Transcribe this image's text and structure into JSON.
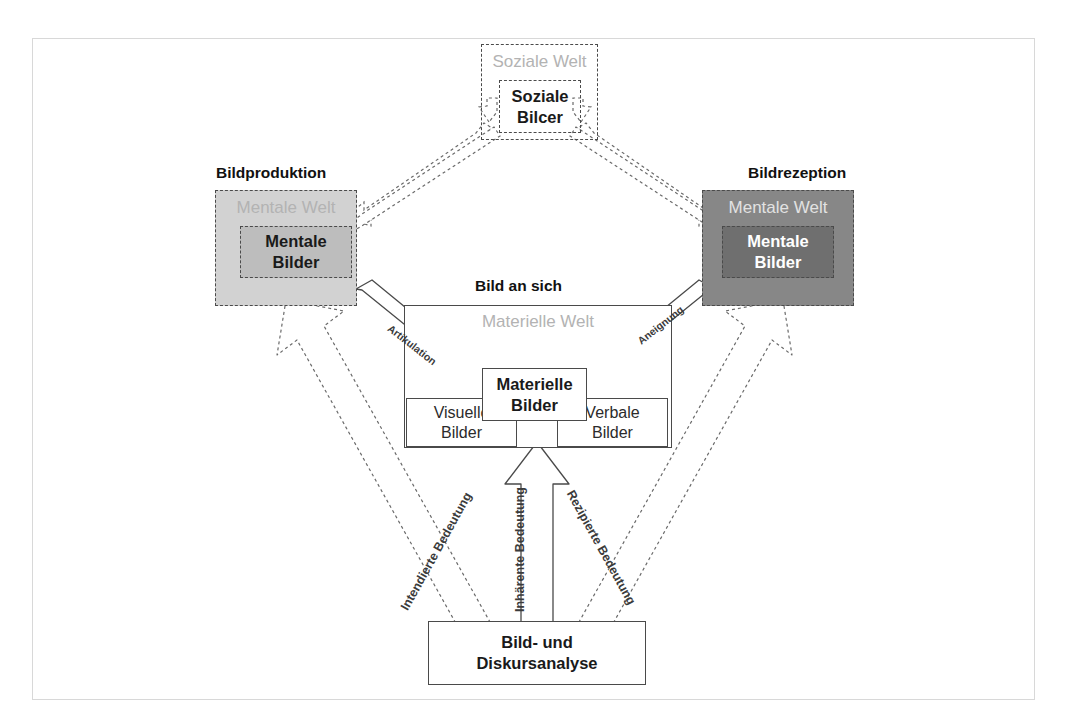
{
  "diagram": {
    "colors": {
      "frame_border": "#d8d8d8",
      "dashed_stroke": "#4a4a4a",
      "solid_stroke": "#4a4a4a",
      "mental_world_left_fill": "#d2d2d2",
      "mental_images_left_fill": "#bdbdbd",
      "mental_world_right_fill": "#878787",
      "mental_images_right_fill": "#6f6f6f",
      "faded_label": "#b3b3b3",
      "faded_label_on_dark": "#e2e2e2",
      "text": "#1a1a1a"
    },
    "headings": {
      "bildproduktion": "Bildproduktion",
      "bildrezeption": "Bildrezeption",
      "bild_an_sich": "Bild an sich"
    },
    "worlds": {
      "soziale_welt": {
        "world_label": "Soziale Welt",
        "inner_label": "Soziale\nBilcer",
        "inner_line1": "Soziale",
        "inner_line2": "Bilcer"
      },
      "mentale_welt_produktion": {
        "world_label": "Mentale Welt",
        "inner_line1": "Mentale",
        "inner_line2": "Bilder"
      },
      "mentale_welt_rezeption": {
        "world_label": "Mentale Welt",
        "inner_line1": "Mentale",
        "inner_line2": "Bilder"
      },
      "materielle_welt": {
        "world_label": "Materielle Welt",
        "inner_line1": "Materielle",
        "inner_line2": "Bilder",
        "visuelle_line1": "Visuelle",
        "visuelle_line2": "Bilder",
        "verbale_line1": "Verbale",
        "verbale_line2": "Bilder"
      }
    },
    "analysis_box": {
      "line1": "Bild- und",
      "line2": "Diskursanalyse"
    },
    "arrow_labels": {
      "artikulation": "Artikulation",
      "aneignung": "Aneignung",
      "intendierte_bedeutung": "Intendierte Bedeutung",
      "inhaerente_bedeutung": "Inhärente Bedeutung",
      "rezipierte_bedeutung": "Rezipierte Bedeutung"
    }
  }
}
